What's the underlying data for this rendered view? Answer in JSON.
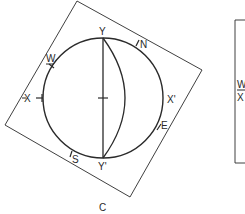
{
  "figure": {
    "caption": "C",
    "type": "stereonet"
  },
  "stereonet": {
    "labels": {
      "top": "Y",
      "bottom": "Y'",
      "left": "X",
      "right": "X'",
      "north": "N",
      "south": "S",
      "east": "E",
      "west": "W"
    }
  },
  "adjacent_panel": {
    "labels": {
      "west": "W",
      "x": "X"
    }
  },
  "colors": {
    "line": "#2a2a2a",
    "background": "#ffffff"
  }
}
